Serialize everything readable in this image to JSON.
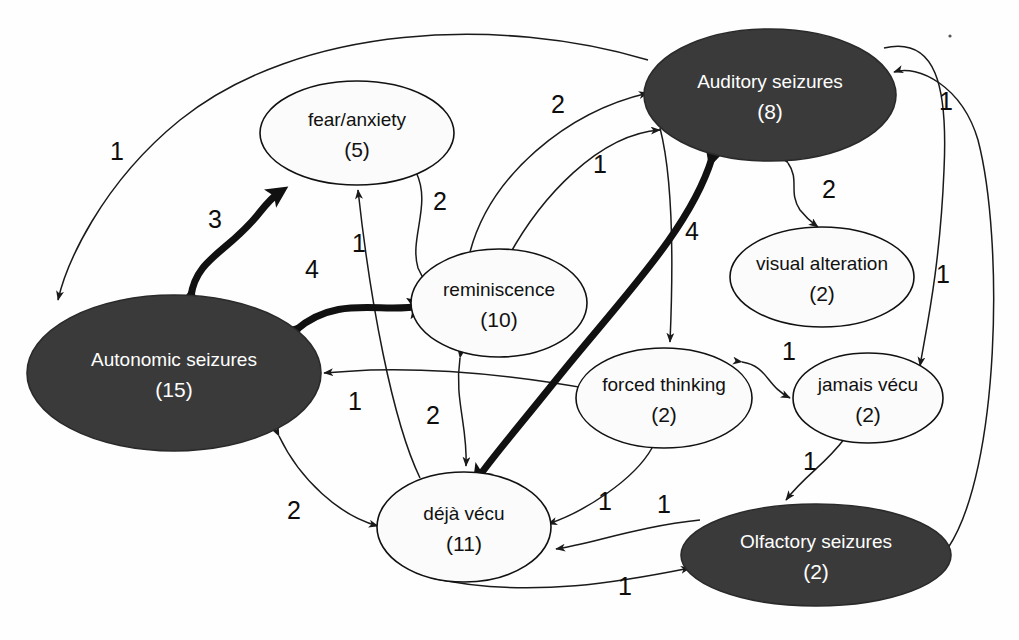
{
  "diagram": {
    "colors": {
      "dark_node_fill": "#3a3a3a",
      "light_node_fill": "#fbfbfb",
      "stroke": "#111111",
      "dark_node_text": "#ffffff",
      "light_node_text": "#111111"
    },
    "nodes": [
      {
        "id": "auditory",
        "label": "Auditory seizures",
        "count": "(8)",
        "style": "dark",
        "cx": 770,
        "cy": 95,
        "rx": 126,
        "ry": 66
      },
      {
        "id": "autonomic",
        "label": "Autonomic seizures",
        "count": "(15)",
        "style": "dark",
        "cx": 174,
        "cy": 373,
        "rx": 147,
        "ry": 78
      },
      {
        "id": "olfactory",
        "label": "Olfactory seizures",
        "count": "(2)",
        "style": "dark",
        "cx": 816,
        "cy": 555,
        "rx": 135,
        "ry": 51
      },
      {
        "id": "fear",
        "label": "fear/anxiety",
        "count": "(5)",
        "style": "light",
        "cx": 357,
        "cy": 133,
        "rx": 97,
        "ry": 52
      },
      {
        "id": "reminiscence",
        "label": "reminiscence",
        "count": "(10)",
        "style": "light",
        "cx": 499,
        "cy": 303,
        "rx": 88,
        "ry": 54
      },
      {
        "id": "visual",
        "label": "visual alteration",
        "count": "(2)",
        "style": "light",
        "cx": 822,
        "cy": 277,
        "rx": 92,
        "ry": 50
      },
      {
        "id": "forced",
        "label": "forced thinking",
        "count": "(2)",
        "style": "light",
        "cx": 664,
        "cy": 398,
        "rx": 88,
        "ry": 50
      },
      {
        "id": "jamais",
        "label": "jamais vécu",
        "count": "(2)",
        "style": "light",
        "cx": 868,
        "cy": 398,
        "rx": 75,
        "ry": 45
      },
      {
        "id": "deja",
        "label": "déjà vécu",
        "count": "(11)",
        "style": "light",
        "cx": 464,
        "cy": 527,
        "rx": 87,
        "ry": 55
      }
    ],
    "edges": [
      {
        "id": "auditory-autonomic",
        "from": "auditory",
        "to": "autonomic",
        "weight": "1",
        "thickness": "thin",
        "direction": "one-way",
        "label_x": 117,
        "label_y": 160
      },
      {
        "id": "autonomic-fear",
        "from": "autonomic",
        "to": "fear",
        "weight": "3",
        "thickness": "bold",
        "direction": "two-way",
        "label_x": 215,
        "label_y": 228
      },
      {
        "id": "autonomic-reminiscence",
        "from": "autonomic",
        "to": "reminiscence",
        "weight": "4",
        "thickness": "bold",
        "direction": "two-way",
        "label_x": 312,
        "label_y": 278
      },
      {
        "id": "fear-reminiscence",
        "from": "fear",
        "to": "reminiscence",
        "weight": "2",
        "thickness": "thin",
        "direction": "two-way",
        "label_x": 440,
        "label_y": 210
      },
      {
        "id": "deja-fear",
        "from": "deja",
        "to": "fear",
        "weight": "1",
        "thickness": "thin",
        "direction": "one-way",
        "label_x": 359,
        "label_y": 252
      },
      {
        "id": "reminiscence-auditory",
        "from": "reminiscence",
        "to": "auditory",
        "weight": "2",
        "thickness": "thin",
        "direction": "one-way",
        "label_x": 558,
        "label_y": 113
      },
      {
        "id": "forced-auditory",
        "from": "forced",
        "to": "auditory",
        "weight": "1",
        "thickness": "thin",
        "direction": "one-way",
        "label_x": 600,
        "label_y": 173
      },
      {
        "id": "auditory-deja",
        "from": "auditory",
        "to": "deja",
        "weight": "4",
        "thickness": "bold",
        "direction": "two-way",
        "label_x": 692,
        "label_y": 240
      },
      {
        "id": "auditory-visual",
        "from": "auditory",
        "to": "visual",
        "weight": "2",
        "thickness": "thin",
        "direction": "two-way",
        "label_x": 829,
        "label_y": 198
      },
      {
        "id": "autonomic-right-in",
        "from": "forced",
        "to": "autonomic",
        "weight": "1",
        "thickness": "thin",
        "direction": "one-way",
        "label_x": 355,
        "label_y": 410
      },
      {
        "id": "reminiscence-deja",
        "from": "reminiscence",
        "to": "deja",
        "weight": "2",
        "thickness": "thin",
        "direction": "two-way",
        "label_x": 433,
        "label_y": 424
      },
      {
        "id": "autonomic-deja",
        "from": "autonomic",
        "to": "deja",
        "weight": "2",
        "thickness": "thin",
        "direction": "two-way",
        "label_x": 294,
        "label_y": 519
      },
      {
        "id": "forced-jamais",
        "from": "forced",
        "to": "jamais",
        "weight": "1",
        "thickness": "thin",
        "direction": "two-way",
        "label_x": 789,
        "label_y": 360
      },
      {
        "id": "jamais-olfactory",
        "from": "jamais",
        "to": "olfactory",
        "weight": "1",
        "thickness": "thin",
        "direction": "two-way",
        "label_x": 810,
        "label_y": 470
      },
      {
        "id": "forced-deja",
        "from": "forced",
        "to": "deja",
        "weight": "1",
        "thickness": "thin",
        "direction": "two-way",
        "label_x": 605,
        "label_y": 510
      },
      {
        "id": "olfactory-deja",
        "from": "olfactory",
        "to": "deja",
        "weight": "1",
        "thickness": "thin",
        "direction": "one-way",
        "label_x": 664,
        "label_y": 513
      },
      {
        "id": "deja-olfactory",
        "from": "deja",
        "to": "olfactory",
        "weight": "1",
        "thickness": "thin",
        "direction": "one-way",
        "label_x": 625,
        "label_y": 595
      },
      {
        "id": "right-outer-auditory",
        "from": "olfactory",
        "to": "auditory",
        "weight": "1",
        "thickness": "thin",
        "direction": "one-way",
        "label_x": 946,
        "label_y": 110
      },
      {
        "id": "right-outer-jamais",
        "from": "auditory",
        "to": "jamais",
        "weight": "1",
        "thickness": "thin",
        "direction": "one-way",
        "label_x": 943,
        "label_y": 283
      }
    ]
  }
}
